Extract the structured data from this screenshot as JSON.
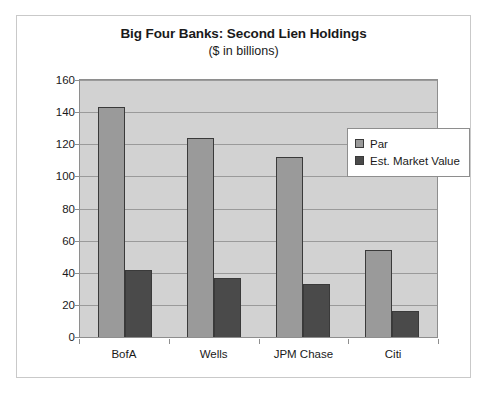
{
  "chart_data": {
    "type": "bar",
    "title": "Big Four Banks: Second Lien Holdings",
    "subtitle": "($ in billions)",
    "xlabel": "",
    "ylabel": "",
    "ylim": [
      0,
      160
    ],
    "ytick_step": 20,
    "yticks": [
      "160",
      "140",
      "120",
      "100",
      "80",
      "60",
      "40",
      "20",
      "0"
    ],
    "grid": true,
    "legend_position": "inside-top-right",
    "categories": [
      "BofA",
      "Wells",
      "JPM Chase",
      "Citi"
    ],
    "series": [
      {
        "name": "Par",
        "color": "#9a9a9a",
        "values": [
          143,
          124,
          112,
          54
        ]
      },
      {
        "name": "Est. Market Value",
        "color": "#4a4a4a",
        "values": [
          42,
          37,
          33,
          16
        ]
      }
    ]
  },
  "legend": {
    "items": [
      {
        "label": "Par"
      },
      {
        "label": "Est. Market Value"
      }
    ]
  }
}
